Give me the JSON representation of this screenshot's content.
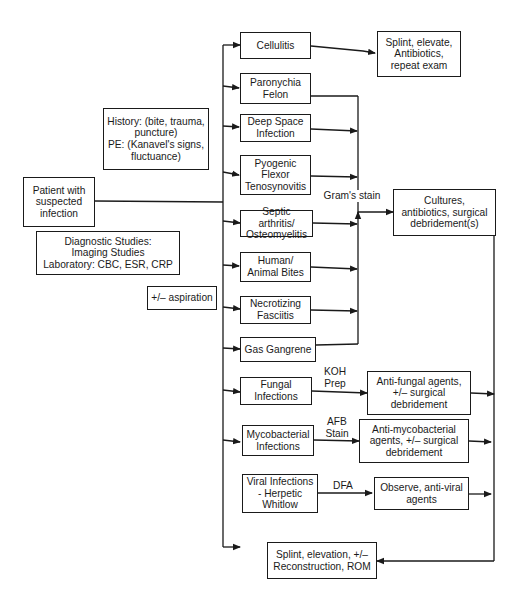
{
  "diagram": {
    "type": "flowchart",
    "start": {
      "id": "patient",
      "label": "Patient with\nsuspected\ninfection"
    },
    "info_boxes": [
      {
        "id": "history",
        "label": "History: (bite, trauma,\npuncture)\nPE: (Kanavel's signs,\nfluctuance)"
      },
      {
        "id": "diagnostics",
        "label": "Diagnostic Studies:\nImaging Studies\nLaboratory: CBC, ESR, CRP"
      },
      {
        "id": "aspiration",
        "label": "+/– aspiration"
      }
    ],
    "conditions": [
      {
        "id": "cellulitis",
        "label": "Cellulitis"
      },
      {
        "id": "paronychia",
        "label": "Paronychia\nFelon"
      },
      {
        "id": "deep-space",
        "label": "Deep Space\nInfection"
      },
      {
        "id": "pyogenic",
        "label": "Pyogenic\nFlexor\nTenosynovitis"
      },
      {
        "id": "septic",
        "label": "Septic arthritis/\nOsteomyelitis"
      },
      {
        "id": "bites",
        "label": "Human/\nAnimal Bites"
      },
      {
        "id": "necrotizing",
        "label": "Necrotizing\nFasciitis"
      },
      {
        "id": "gas-gangrene",
        "label": "Gas Gangrene"
      },
      {
        "id": "fungal",
        "label": "Fungal\nInfections"
      },
      {
        "id": "mycobacterial",
        "label": "Mycobacterial\nInfections"
      },
      {
        "id": "viral",
        "label": "Viral Infections\n- Herpetic\nWhitlow"
      }
    ],
    "edge_labels": {
      "gram": "Gram's stain",
      "koh": "KOH\nPrep",
      "afb": "AFB\nStain",
      "dfa": "DFA"
    },
    "treatments": [
      {
        "id": "splint-elevate",
        "label": "Splint, elevate,\nAntibiotics,\nrepeat exam"
      },
      {
        "id": "cultures",
        "label": "Cultures,\nantibiotics, surgical\ndebridement(s)"
      },
      {
        "id": "antifungal",
        "label": "Anti-fungal agents,\n+/– surgical\ndebridement"
      },
      {
        "id": "antimyco",
        "label": "Anti-mycobacterial\nagents, +/– surgical\ndebridement"
      },
      {
        "id": "antiviral",
        "label": "Observe, anti-viral\nagents"
      },
      {
        "id": "final",
        "label": "Splint, elevation, +/–\nReconstruction, ROM"
      }
    ]
  }
}
